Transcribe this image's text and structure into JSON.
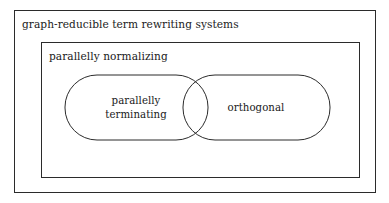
{
  "figure": {
    "type": "euler-containment-diagram",
    "width": 389,
    "height": 203,
    "background_color": "#ffffff",
    "stroke_color": "#2b2b2b",
    "text_color": "#1a1a1a"
  },
  "regions": {
    "outer": {
      "label": "graph-reducible term rewriting systems",
      "shape": "rectangle",
      "x": 14,
      "y": 10,
      "width": 361,
      "height": 182,
      "label_x": 22,
      "label_y": 28
    },
    "middle": {
      "label": "parallelly normalizing",
      "shape": "rectangle",
      "x": 41,
      "y": 42,
      "width": 318,
      "height": 135,
      "label_x": 49,
      "label_y": 60
    },
    "left_set": {
      "label_line1": "parallelly",
      "label_line2": "terminating",
      "shape": "rounded-rectangle",
      "x": 65,
      "y": 75,
      "width": 143,
      "height": 65,
      "radius": 32,
      "label_cx": 136,
      "label_cy": 104
    },
    "right_set": {
      "label": "orthogonal",
      "shape": "rounded-rectangle",
      "x": 183,
      "y": 75,
      "width": 147,
      "height": 65,
      "radius": 32,
      "label_cx": 256,
      "label_cy": 111
    },
    "intersection": {
      "label": "",
      "shape": "lens",
      "x": 183,
      "y": 75,
      "width": 25,
      "height": 65
    }
  }
}
